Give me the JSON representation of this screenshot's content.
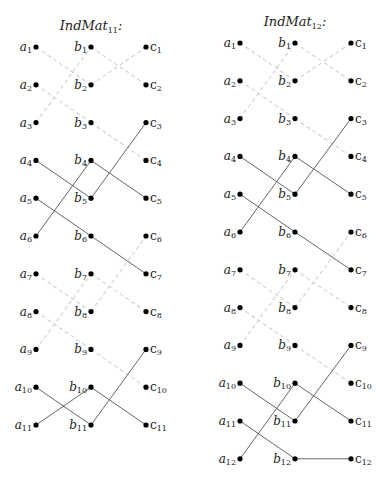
{
  "graphs": [
    {
      "title": "IndMat",
      "title_sub": "11",
      "title_suffix": ":",
      "rows": 11,
      "edges": [
        {
          "from": "a1",
          "to": "b2",
          "style": "dashed"
        },
        {
          "from": "a2",
          "to": "b3",
          "style": "dashed"
        },
        {
          "from": "a3",
          "to": "b1",
          "style": "dashed"
        },
        {
          "from": "b1",
          "to": "c2",
          "style": "dashed"
        },
        {
          "from": "b2",
          "to": "c1",
          "style": "dashed"
        },
        {
          "from": "b3",
          "to": "c4",
          "style": "dashed"
        },
        {
          "from": "a4",
          "to": "b5",
          "style": "solid"
        },
        {
          "from": "a5",
          "to": "b6",
          "style": "solid"
        },
        {
          "from": "a6",
          "to": "b4",
          "style": "solid"
        },
        {
          "from": "b4",
          "to": "c5",
          "style": "solid"
        },
        {
          "from": "b5",
          "to": "c3",
          "style": "solid"
        },
        {
          "from": "b6",
          "to": "c7",
          "style": "solid"
        },
        {
          "from": "a7",
          "to": "b8",
          "style": "dashed"
        },
        {
          "from": "a8",
          "to": "b9",
          "style": "dashed"
        },
        {
          "from": "a9",
          "to": "b7",
          "style": "dashed"
        },
        {
          "from": "b7",
          "to": "c8",
          "style": "dashed"
        },
        {
          "from": "b8",
          "to": "c6",
          "style": "dashed"
        },
        {
          "from": "b9",
          "to": "c10",
          "style": "dashed"
        },
        {
          "from": "a10",
          "to": "b11",
          "style": "solid"
        },
        {
          "from": "a11",
          "to": "b10",
          "style": "solid"
        },
        {
          "from": "b10",
          "to": "c11",
          "style": "solid"
        },
        {
          "from": "b11",
          "to": "c9",
          "style": "solid"
        }
      ]
    },
    {
      "title": "IndMat",
      "title_sub": "12",
      "title_suffix": ":",
      "rows": 12,
      "edges": [
        {
          "from": "a1",
          "to": "b2",
          "style": "dashed"
        },
        {
          "from": "a2",
          "to": "b3",
          "style": "dashed"
        },
        {
          "from": "a3",
          "to": "b1",
          "style": "dashed"
        },
        {
          "from": "b1",
          "to": "c2",
          "style": "dashed"
        },
        {
          "from": "b2",
          "to": "c1",
          "style": "dashed"
        },
        {
          "from": "b3",
          "to": "c4",
          "style": "dashed"
        },
        {
          "from": "a4",
          "to": "b5",
          "style": "solid"
        },
        {
          "from": "a5",
          "to": "b6",
          "style": "solid"
        },
        {
          "from": "a6",
          "to": "b4",
          "style": "solid"
        },
        {
          "from": "b4",
          "to": "c5",
          "style": "solid"
        },
        {
          "from": "b5",
          "to": "c3",
          "style": "solid"
        },
        {
          "from": "b6",
          "to": "c7",
          "style": "solid"
        },
        {
          "from": "a7",
          "to": "b8",
          "style": "dashed"
        },
        {
          "from": "a8",
          "to": "b9",
          "style": "dashed"
        },
        {
          "from": "a9",
          "to": "b7",
          "style": "dashed"
        },
        {
          "from": "b7",
          "to": "c8",
          "style": "dashed"
        },
        {
          "from": "b8",
          "to": "c6",
          "style": "dashed"
        },
        {
          "from": "b9",
          "to": "c10",
          "style": "dashed"
        },
        {
          "from": "a10",
          "to": "b11",
          "style": "solid"
        },
        {
          "from": "a11",
          "to": "b12",
          "style": "solid"
        },
        {
          "from": "a12",
          "to": "b10",
          "style": "solid"
        },
        {
          "from": "b10",
          "to": "c11",
          "style": "solid"
        },
        {
          "from": "b11",
          "to": "c9",
          "style": "solid"
        },
        {
          "from": "b12",
          "to": "c12",
          "style": "solid"
        }
      ]
    }
  ],
  "columns": [
    "a",
    "b",
    "c"
  ]
}
